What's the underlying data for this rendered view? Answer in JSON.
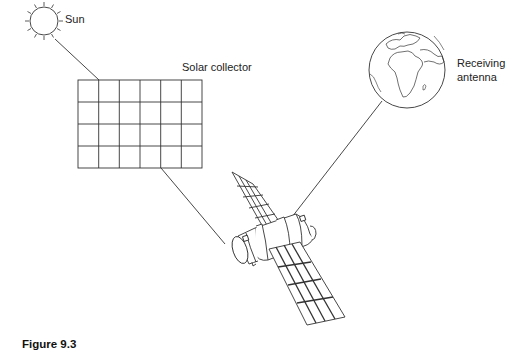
{
  "figure": {
    "caption": "Figure 9.3",
    "labels": {
      "sun": "Sun",
      "solar_collector": "Solar collector",
      "receiving_antenna_line1": "Receiving",
      "receiving_antenna_line2": "antenna"
    },
    "components": {
      "sun": {
        "icon": "sun-icon",
        "center": [
          44,
          21
        ],
        "radius": 14,
        "rays": 12
      },
      "solar_collector": {
        "icon": "solar-panel-grid",
        "columns": 6,
        "rows": 4,
        "x": 78,
        "y": 80,
        "width": 124,
        "height": 88
      },
      "earth": {
        "icon": "globe-icon",
        "center": [
          407,
          70
        ],
        "radius": 38
      },
      "satellite": {
        "icon": "satellite-icon",
        "panels": 2
      }
    },
    "connections": [
      {
        "from": "sun",
        "to": "solar_collector"
      },
      {
        "from": "solar_collector",
        "to": "satellite"
      },
      {
        "from": "satellite",
        "to": "earth"
      }
    ],
    "colors": {
      "line": "#333333",
      "background": "#ffffff"
    }
  }
}
